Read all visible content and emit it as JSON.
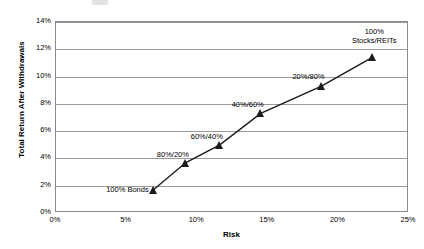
{
  "chart_data": {
    "type": "scatter",
    "title": "",
    "xlabel": "Risk",
    "ylabel": "Total Return After Withdrawals",
    "xlim": [
      0,
      25
    ],
    "ylim": [
      0,
      14
    ],
    "grid": true,
    "legend": "none",
    "x_unit": "%",
    "y_unit": "%",
    "x_ticks": [
      "0%",
      "5%",
      "10%",
      "15%",
      "20%",
      "25%"
    ],
    "x_tick_values": [
      0,
      5,
      10,
      15,
      20,
      25
    ],
    "y_ticks": [
      "0%",
      "2%",
      "4%",
      "6%",
      "8%",
      "10%",
      "12%",
      "14%"
    ],
    "y_tick_values": [
      0,
      2,
      4,
      6,
      8,
      10,
      12,
      14
    ],
    "series_name": "Asset Allocation Efficient Frontier",
    "marker": "triangle",
    "marker_color": "#1a1a1a",
    "line_color": "#1a1a1a",
    "points": [
      {
        "label": "100% Bonds",
        "label_line2": "",
        "x": 6.9,
        "y": 1.7,
        "label_dx": -46,
        "label_dy": 0
      },
      {
        "label": "80%/20%",
        "label_line2": "",
        "x": 9.2,
        "y": 3.7,
        "label_dx": -33,
        "label_dy": -8
      },
      {
        "label": "60%/40%",
        "label_line2": "",
        "x": 11.6,
        "y": 5.0,
        "label_dx": -33,
        "label_dy": -8
      },
      {
        "label": "40%/60%",
        "label_line2": "",
        "x": 14.5,
        "y": 7.3,
        "label_dx": -33,
        "label_dy": -8
      },
      {
        "label": "20%/80%",
        "label_line2": "",
        "x": 18.8,
        "y": 9.3,
        "label_dx": -33,
        "label_dy": -9
      },
      {
        "label": "100%",
        "label_line2": "Stocks/REITs",
        "x": 22.4,
        "y": 11.4,
        "label_dx": -18,
        "label_dy": -25
      }
    ]
  },
  "colors": {
    "grid": "#9a9a9a",
    "frame": "#8a8a8a",
    "series": "#1a1a1a",
    "background": "#ffffff",
    "text": "#000000"
  }
}
